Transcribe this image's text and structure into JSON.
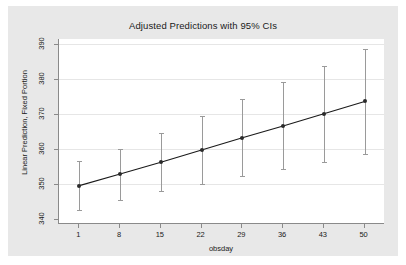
{
  "chart_data": {
    "type": "line",
    "title": "Adjusted Predictions with 95% CIs",
    "xlabel": "obsday",
    "ylabel": "Linear Prediction, Fixed Portion",
    "x": [
      1,
      8,
      15,
      22,
      29,
      36,
      43,
      50
    ],
    "xtick_labels": [
      "1",
      "8",
      "15",
      "22",
      "29",
      "36",
      "43",
      "50"
    ],
    "ytick_labels": [
      "340",
      "350",
      "360",
      "370",
      "380",
      "390"
    ],
    "yticks": [
      340,
      350,
      360,
      370,
      380,
      390
    ],
    "xlim": [
      -2.5,
      53.5
    ],
    "ylim": [
      338.5,
      391.5
    ],
    "grid": "horizontal",
    "legend": "none",
    "series": [
      {
        "name": "Linear Prediction, Fixed Portion",
        "values": [
          349.5,
          352.8,
          356.2,
          359.7,
          363.2,
          366.6,
          370.1,
          373.6
        ],
        "ci_lower": [
          342.5,
          345.5,
          348.0,
          350.0,
          352.3,
          354.2,
          356.4,
          358.6
        ],
        "ci_upper": [
          356.5,
          360.0,
          364.5,
          369.5,
          374.2,
          379.2,
          383.7,
          388.5
        ],
        "marker_color": "#2b2b2b",
        "line_color": "#1a1a1a",
        "ci_color": "#9a9a9a"
      }
    ]
  },
  "colors": {
    "graph_background": "#e8e8e8",
    "plot_background": "#ffffff",
    "axis": "#8a8a8a",
    "gridline": "#e6e6e6"
  }
}
